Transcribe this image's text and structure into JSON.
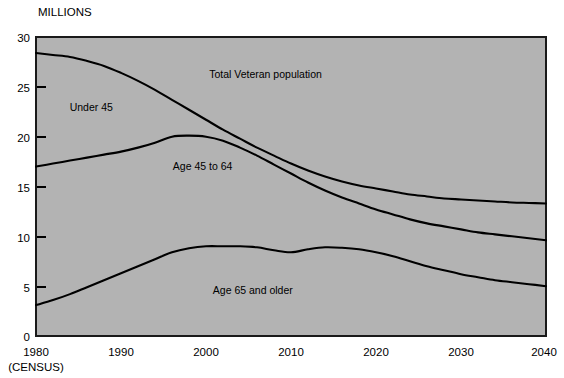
{
  "chart_data": {
    "type": "line",
    "title": "",
    "subtitle": "",
    "ylabel": "MILLIONS",
    "xlabel": "",
    "xlim": [
      1980,
      2040
    ],
    "ylim": [
      0,
      30
    ],
    "grid": false,
    "legend": "inline-annotations",
    "plot_background": "#b3b3b3",
    "line_color": "#000000",
    "border_color": "#000000",
    "y_ticks": [
      0,
      5,
      10,
      15,
      20,
      25,
      30
    ],
    "y_tick_labels": [
      "0",
      "5",
      "10",
      "15",
      "20",
      "25",
      "30"
    ],
    "x_ticks": [
      1980,
      1990,
      2000,
      2010,
      2020,
      2030,
      2040
    ],
    "x_tick_labels": [
      "1980",
      "1990",
      "2000",
      "2010",
      "2020",
      "2030",
      "2040"
    ],
    "x_axis_note": "(CENSUS)",
    "annotations": [
      {
        "text": "Total Veteran population",
        "x": 2007,
        "y": 25.9
      },
      {
        "text": "Under 45",
        "x": 1986.5,
        "y": 22.6
      },
      {
        "text": "Age 45 to 64",
        "x": 1999.6,
        "y": 16.7
      },
      {
        "text": "Age 65 and older",
        "x": 2005.5,
        "y": 4.2
      }
    ],
    "x": [
      1980,
      1982,
      1984,
      1986,
      1988,
      1990,
      1992,
      1994,
      1996,
      1998,
      2000,
      2002,
      2004,
      2006,
      2008,
      2010,
      2012,
      2014,
      2016,
      2018,
      2020,
      2022,
      2024,
      2026,
      2028,
      2030,
      2032,
      2034,
      2036,
      2038,
      2040
    ],
    "series": [
      {
        "name": "Total Veteran population",
        "values": [
          28.4,
          28.2,
          28.0,
          27.6,
          27.1,
          26.4,
          25.6,
          24.7,
          23.7,
          22.7,
          21.7,
          20.7,
          19.8,
          18.9,
          18.1,
          17.3,
          16.6,
          16.0,
          15.5,
          15.1,
          14.8,
          14.5,
          14.2,
          14.0,
          13.8,
          13.7,
          13.6,
          13.5,
          13.4,
          13.35,
          13.3
        ]
      },
      {
        "name": "Age 45 and older (total minus under 45)",
        "values": [
          17.0,
          17.3,
          17.6,
          17.9,
          18.2,
          18.5,
          18.9,
          19.4,
          20.0,
          20.1,
          20.0,
          19.6,
          18.9,
          18.1,
          17.2,
          16.3,
          15.4,
          14.6,
          13.9,
          13.3,
          12.7,
          12.2,
          11.7,
          11.3,
          11.0,
          10.7,
          10.4,
          10.2,
          10.0,
          9.8,
          9.6
        ]
      },
      {
        "name": "Age 65 and older",
        "values": [
          3.1,
          3.6,
          4.2,
          4.9,
          5.6,
          6.3,
          7.0,
          7.7,
          8.4,
          8.8,
          9.0,
          9.0,
          9.0,
          8.9,
          8.6,
          8.4,
          8.7,
          8.9,
          8.85,
          8.7,
          8.4,
          8.0,
          7.5,
          7.0,
          6.6,
          6.2,
          5.9,
          5.6,
          5.4,
          5.2,
          5.0
        ]
      }
    ]
  }
}
